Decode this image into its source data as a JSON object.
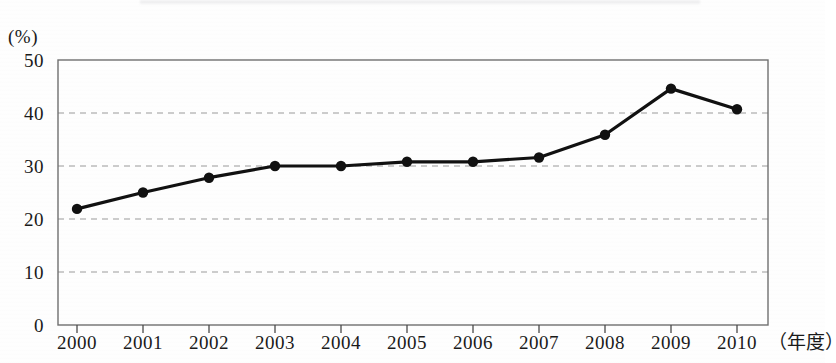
{
  "chart_data": {
    "type": "line",
    "title": "",
    "xlabel": "（年度）",
    "ylabel": "(%)",
    "categories": [
      "2000",
      "2001",
      "2002",
      "2003",
      "2004",
      "2005",
      "2006",
      "2007",
      "2008",
      "2009",
      "2010"
    ],
    "values": [
      21.9,
      25.0,
      27.8,
      30.0,
      30.0,
      30.8,
      30.8,
      31.6,
      35.9,
      44.6,
      40.7
    ],
    "series": [
      {
        "name": "",
        "values": [
          21.9,
          25.0,
          27.8,
          30.0,
          30.0,
          30.8,
          30.8,
          31.6,
          35.9,
          44.6,
          40.7
        ]
      }
    ],
    "ylim": [
      0,
      50
    ],
    "y_ticks": [
      0,
      10,
      20,
      30,
      40,
      50
    ],
    "y_tick_labels": [
      "0",
      "10",
      "20",
      "30",
      "40",
      "50"
    ],
    "grid": true,
    "grid_values": [
      10,
      20,
      30,
      40
    ],
    "legend": "none",
    "marker": "filled-circle",
    "line_color": "#111111",
    "grid_color": "#9a9a9a",
    "frame_color": "#6f6f6f"
  },
  "axis": {
    "unit_label": "(%)",
    "x_title": "（年度）"
  }
}
